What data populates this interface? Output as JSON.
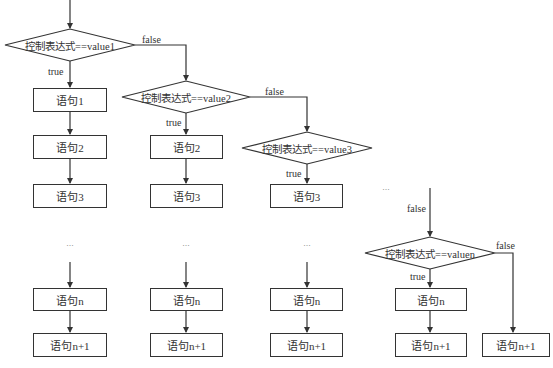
{
  "diagram": {
    "type": "switch-flowchart",
    "edge_labels": {
      "true": "true",
      "false": "false"
    },
    "ellipsis": "...",
    "columns": [
      {
        "condition_prefix": "控制表达式==",
        "condition_value": "value1",
        "statements": [
          "语句1",
          "语句2",
          "语句3"
        ],
        "statement_n": "语句n",
        "statement_n1": "语句n+1"
      },
      {
        "condition_prefix": "控制表达式==",
        "condition_value": "value2",
        "statements": [
          "语句2",
          "语句3"
        ],
        "statement_n": "语句n",
        "statement_n1": "语句n+1"
      },
      {
        "condition_prefix": "控制表达式==",
        "condition_value": "value3",
        "statements": [
          "语句3"
        ],
        "statement_n": "语句n",
        "statement_n1": "语句n+1"
      },
      {
        "condition_prefix": "控制表达式==",
        "condition_value": "valuen",
        "statements": [],
        "statement_n": "语句n",
        "statement_n1": "语句n+1"
      }
    ],
    "default_statement": "语句n+1",
    "line_color": "#333333"
  }
}
